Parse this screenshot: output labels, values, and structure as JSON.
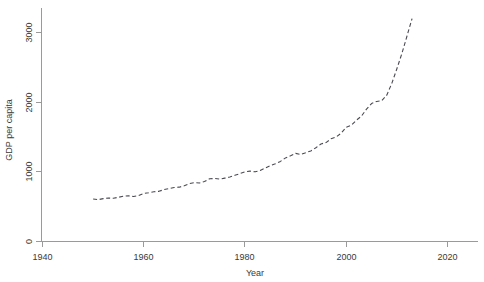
{
  "chart_data": {
    "type": "line",
    "title": "",
    "xlabel": "Year",
    "ylabel": "GDP per capita",
    "xlim": [
      1940,
      2020
    ],
    "ylim": [
      0,
      3350
    ],
    "xticks": [
      1940,
      1960,
      1980,
      2000,
      2020
    ],
    "xtick_labels": [
      "1940",
      "1960",
      "1980",
      "2000",
      "2020"
    ],
    "yticks": [
      0,
      1000,
      2000,
      3000
    ],
    "ytick_labels": [
      "0",
      "1000",
      "2000",
      "3000"
    ],
    "grid": false,
    "legend": false,
    "line_style": "dashed",
    "line_color": "#4a4a52",
    "series": [
      {
        "name": "GDP per capita",
        "x": [
          1950,
          1951,
          1952,
          1953,
          1954,
          1955,
          1956,
          1957,
          1958,
          1959,
          1960,
          1961,
          1962,
          1963,
          1964,
          1965,
          1966,
          1967,
          1968,
          1969,
          1970,
          1971,
          1972,
          1973,
          1974,
          1975,
          1976,
          1977,
          1978,
          1979,
          1980,
          1981,
          1982,
          1983,
          1984,
          1985,
          1986,
          1987,
          1988,
          1989,
          1990,
          1991,
          1992,
          1993,
          1994,
          1995,
          1996,
          1997,
          1998,
          1999,
          2000,
          2001,
          2002,
          2003,
          2004,
          2005,
          2006,
          2007,
          2008,
          2009,
          2010
        ],
        "values": [
          610,
          600,
          615,
          625,
          620,
          635,
          650,
          655,
          645,
          660,
          690,
          700,
          715,
          720,
          745,
          760,
          775,
          780,
          800,
          830,
          845,
          840,
          860,
          900,
          905,
          895,
          910,
          925,
          950,
          975,
          1000,
          1010,
          1000,
          1020,
          1055,
          1090,
          1115,
          1150,
          1200,
          1230,
          1265,
          1250,
          1275,
          1300,
          1345,
          1400,
          1420,
          1475,
          1500,
          1555,
          1640,
          1670,
          1740,
          1800,
          1900,
          1980,
          2010,
          2020,
          2100,
          2270,
          2480
        ]
      }
    ],
    "series_extension": {
      "name": "GDP per capita (steep tail)",
      "x": [
        2010,
        2011,
        2012,
        2013
      ],
      "values": [
        2480,
        2700,
        2950,
        3200
      ]
    }
  },
  "axes": {
    "x_axis_name": "x-axis",
    "y_axis_name": "y-axis"
  }
}
